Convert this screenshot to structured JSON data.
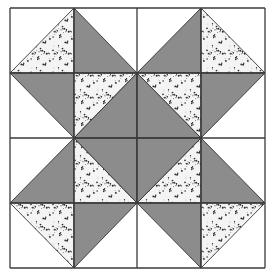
{
  "grid": {
    "rows": 4,
    "cols": 4
  },
  "colors": {
    "background": "#ffffff",
    "solid": "#8c8c8c",
    "print_base": "#f4f4f4",
    "print_speck": "#2a2a2a",
    "line": "#3a3a3a"
  },
  "fabrics": [
    "white",
    "solid",
    "print"
  ],
  "pieces": [
    {
      "cell": [
        0,
        0
      ],
      "half": "br",
      "fabric": "print"
    },
    {
      "cell": [
        1,
        0
      ],
      "half": "bl",
      "fabric": "solid"
    },
    {
      "cell": [
        2,
        0
      ],
      "half": "br",
      "fabric": "solid"
    },
    {
      "cell": [
        3,
        0
      ],
      "half": "bl",
      "fabric": "print"
    },
    {
      "cell": [
        0,
        1
      ],
      "half": "tr",
      "fabric": "solid"
    },
    {
      "cell": [
        1,
        1
      ],
      "half": "tl",
      "fabric": "print"
    },
    {
      "cell": [
        1,
        1
      ],
      "half": "br",
      "fabric": "solid"
    },
    {
      "cell": [
        2,
        1
      ],
      "half": "tr",
      "fabric": "print"
    },
    {
      "cell": [
        2,
        1
      ],
      "half": "bl",
      "fabric": "solid"
    },
    {
      "cell": [
        3,
        1
      ],
      "half": "tl",
      "fabric": "solid"
    },
    {
      "cell": [
        0,
        2
      ],
      "half": "br",
      "fabric": "solid"
    },
    {
      "cell": [
        1,
        2
      ],
      "half": "bl",
      "fabric": "print"
    },
    {
      "cell": [
        1,
        2
      ],
      "half": "tr",
      "fabric": "solid"
    },
    {
      "cell": [
        2,
        2
      ],
      "half": "br",
      "fabric": "print"
    },
    {
      "cell": [
        2,
        2
      ],
      "half": "tl",
      "fabric": "solid"
    },
    {
      "cell": [
        3,
        2
      ],
      "half": "bl",
      "fabric": "solid"
    },
    {
      "cell": [
        0,
        3
      ],
      "half": "tr",
      "fabric": "print"
    },
    {
      "cell": [
        1,
        3
      ],
      "half": "tl",
      "fabric": "solid"
    },
    {
      "cell": [
        2,
        3
      ],
      "half": "tr",
      "fabric": "solid"
    },
    {
      "cell": [
        3,
        3
      ],
      "half": "tl",
      "fabric": "print"
    }
  ]
}
